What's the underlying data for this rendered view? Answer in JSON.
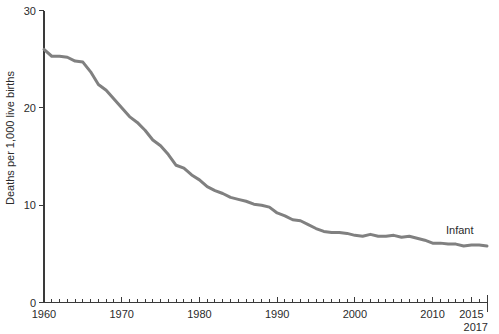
{
  "chart_data": {
    "type": "line",
    "title": "",
    "subtitle": "",
    "xlabel": "",
    "ylabel": "Deaths per 1,000 live births",
    "xlim": [
      1960,
      2017
    ],
    "ylim": [
      0,
      30
    ],
    "grid": false,
    "legend_position": "inline-right",
    "y_ticks": [
      0,
      10,
      20,
      30
    ],
    "y_tick_labels": [
      "0",
      "10",
      "20",
      "30"
    ],
    "x_major_ticks": [
      1960,
      1970,
      1980,
      1990,
      2000,
      2010,
      2015
    ],
    "x_major_tick_labels": [
      "1960",
      "1970",
      "1980",
      "1990",
      "2000",
      "2010",
      "2015"
    ],
    "x_end_tick": 2017,
    "x_end_tick_label": "2017",
    "x_minor_tick_step": 1,
    "series": [
      {
        "name": "Infant",
        "label": "Infant",
        "color": "#808080",
        "x": [
          1960,
          1961,
          1962,
          1963,
          1964,
          1965,
          1966,
          1967,
          1968,
          1969,
          1970,
          1971,
          1972,
          1973,
          1974,
          1975,
          1976,
          1977,
          1978,
          1979,
          1980,
          1981,
          1982,
          1983,
          1984,
          1985,
          1986,
          1987,
          1988,
          1989,
          1990,
          1991,
          1992,
          1993,
          1994,
          1995,
          1996,
          1997,
          1998,
          1999,
          2000,
          2001,
          2002,
          2003,
          2004,
          2005,
          2006,
          2007,
          2008,
          2009,
          2010,
          2011,
          2012,
          2013,
          2014,
          2015,
          2016,
          2017
        ],
        "values": [
          26.0,
          25.3,
          25.3,
          25.2,
          24.8,
          24.7,
          23.7,
          22.4,
          21.8,
          20.9,
          20.0,
          19.1,
          18.5,
          17.7,
          16.7,
          16.1,
          15.2,
          14.1,
          13.8,
          13.1,
          12.6,
          11.9,
          11.5,
          11.2,
          10.8,
          10.6,
          10.4,
          10.1,
          10.0,
          9.8,
          9.2,
          8.9,
          8.5,
          8.4,
          8.0,
          7.6,
          7.3,
          7.2,
          7.2,
          7.1,
          6.9,
          6.8,
          7.0,
          6.8,
          6.8,
          6.9,
          6.7,
          6.8,
          6.6,
          6.4,
          6.1,
          6.1,
          6.0,
          6.0,
          5.8,
          5.9,
          5.9,
          5.8
        ]
      }
    ]
  },
  "axis": {
    "y_title": "Deaths per 1,000 live births"
  },
  "colors": {
    "line": "#808080",
    "axis": "#3a3a3a",
    "text": "#2b2b2b",
    "background": "#ffffff"
  }
}
